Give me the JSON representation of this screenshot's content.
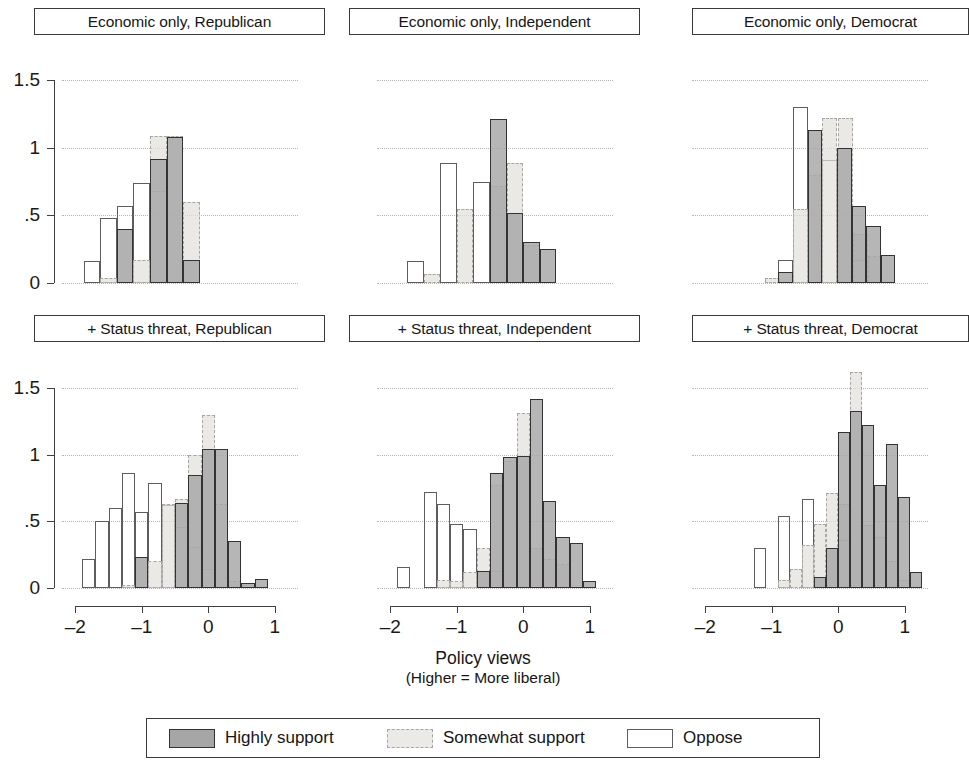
{
  "figure": {
    "xaxis_title": "Policy views",
    "xaxis_subtitle": "(Higher = More liberal)"
  },
  "legend": {
    "items": [
      {
        "key": "highly",
        "label": "Highly support",
        "swatch": "solid-gray-fill-swatch"
      },
      {
        "key": "somewhat",
        "label": "Somewhat support",
        "swatch": "dashed-light-gray-swatch"
      },
      {
        "key": "oppose",
        "label": "Oppose",
        "swatch": "hollow-outline-swatch"
      }
    ]
  },
  "chart_data": {
    "type": "bar",
    "chart_kind": "small-multiples histogram (density)",
    "title": "",
    "xlabel": "Policy views (Higher = More liberal)",
    "ylabel": "",
    "xlim": [
      -2.2,
      1.35
    ],
    "ylim": [
      0,
      1.5
    ],
    "xticks": [
      -2,
      -1,
      0,
      1
    ],
    "xtick_labels": [
      "–2",
      "–1",
      "0",
      "1"
    ],
    "yticks": [
      0,
      0.5,
      1,
      1.5
    ],
    "ytick_labels": [
      "0",
      ".5",
      "1",
      "1.5"
    ],
    "grid": "horizontal dotted gridlines at 0, .5, 1, 1.5",
    "legend_position": "bottom, outside, boxed",
    "series_names": [
      "Highly support",
      "Somewhat support",
      "Oppose"
    ],
    "panels": [
      {
        "id": "econ-republican",
        "title": "Economic only, Republican",
        "row": 0,
        "col": 0,
        "series": [
          {
            "name": "Oppose",
            "key": "oppose",
            "bin_width": 0.25,
            "bins": [
              -1.875,
              -1.625,
              -1.375,
              -1.125,
              -0.875
            ],
            "values": [
              0.16,
              0.48,
              0.57,
              0.74,
              0.68
            ]
          },
          {
            "name": "Somewhat support",
            "key": "somewhat",
            "bin_width": 0.25,
            "bins": [
              -1.625,
              -1.375,
              -1.125,
              -0.875,
              -0.625,
              -0.375
            ],
            "values": [
              0.04,
              0.4,
              0.17,
              1.09,
              1.09,
              0.6
            ]
          },
          {
            "name": "Highly support",
            "key": "highly",
            "bin_width": 0.25,
            "bins": [
              -1.375,
              -0.875,
              -0.625,
              -0.375
            ],
            "values": [
              0.4,
              0.92,
              1.08,
              0.17
            ]
          }
        ]
      },
      {
        "id": "econ-independent",
        "title": "Economic only, Independent",
        "row": 0,
        "col": 1,
        "series": [
          {
            "name": "Oppose",
            "key": "oppose",
            "bin_width": 0.25,
            "bins": [
              -1.75,
              -1.25,
              -0.75
            ],
            "values": [
              0.16,
              0.89,
              0.75
            ]
          },
          {
            "name": "Somewhat support",
            "key": "somewhat",
            "bin_width": 0.25,
            "bins": [
              -1.5,
              -1.0,
              -0.5,
              -0.25,
              0.0
            ],
            "values": [
              0.07,
              0.55,
              0.72,
              0.89,
              0.28
            ]
          },
          {
            "name": "Highly support",
            "key": "highly",
            "bin_width": 0.25,
            "bins": [
              -0.5,
              -0.25,
              0.0,
              0.25
            ],
            "values": [
              1.21,
              0.52,
              0.3,
              0.25
            ]
          }
        ]
      },
      {
        "id": "econ-democrat",
        "title": "Economic only, Democrat",
        "row": 0,
        "col": 2,
        "series": [
          {
            "name": "Oppose",
            "key": "oppose",
            "bin_width": 0.22,
            "bins": [
              -0.9,
              -0.68,
              -0.24,
              0.2
            ],
            "values": [
              0.17,
              1.3,
              0.91,
              0.17
            ]
          },
          {
            "name": "Somewhat support",
            "key": "somewhat",
            "bin_width": 0.22,
            "bins": [
              -1.1,
              -0.68,
              -0.46,
              -0.24,
              0.0,
              0.22,
              0.44
            ],
            "values": [
              0.04,
              0.55,
              0.8,
              1.22,
              1.22,
              0.36,
              0.2
            ]
          },
          {
            "name": "Highly support",
            "key": "highly",
            "bin_width": 0.22,
            "bins": [
              -0.9,
              -0.46,
              -0.02,
              0.2,
              0.42,
              0.64
            ],
            "values": [
              0.08,
              1.13,
              1.0,
              0.57,
              0.42,
              0.21
            ]
          }
        ]
      },
      {
        "id": "status-republican",
        "title": "+ Status threat, Republican",
        "row": 1,
        "col": 0,
        "series": [
          {
            "name": "Oppose",
            "key": "oppose",
            "bin_width": 0.2,
            "bins": [
              -1.9,
              -1.7,
              -1.5,
              -1.3,
              -1.1,
              -0.9,
              -0.7,
              -0.5,
              -0.3,
              -0.1
            ],
            "values": [
              0.22,
              0.5,
              0.6,
              0.86,
              0.57,
              0.79,
              0.62,
              0.46,
              0.31,
              0.14
            ]
          },
          {
            "name": "Somewhat support",
            "key": "somewhat",
            "bin_width": 0.2,
            "bins": [
              -1.3,
              -1.1,
              -0.9,
              -0.7,
              -0.5,
              -0.3,
              -0.1,
              0.1,
              0.3,
              0.5
            ],
            "values": [
              0.02,
              0.23,
              0.2,
              0.63,
              0.67,
              1.0,
              1.3,
              0.63,
              0.05,
              0.04
            ]
          },
          {
            "name": "Highly support",
            "key": "highly",
            "bin_width": 0.2,
            "bins": [
              -1.1,
              -0.5,
              -0.3,
              -0.1,
              0.1,
              0.3,
              0.5,
              0.7
            ],
            "values": [
              0.23,
              0.64,
              0.85,
              1.04,
              1.04,
              0.35,
              0.04,
              0.07
            ]
          }
        ]
      },
      {
        "id": "status-independent",
        "title": "+ Status threat, Independent",
        "row": 1,
        "col": 1,
        "series": [
          {
            "name": "Oppose",
            "key": "oppose",
            "bin_width": 0.2,
            "bins": [
              -1.9,
              -1.5,
              -1.3,
              -1.1,
              -0.9,
              -0.5
            ],
            "values": [
              0.16,
              0.72,
              0.63,
              0.48,
              0.44,
              0.13
            ]
          },
          {
            "name": "Somewhat support",
            "key": "somewhat",
            "bin_width": 0.2,
            "bins": [
              -1.3,
              -1.1,
              -0.9,
              -0.7,
              -0.5,
              -0.3,
              -0.1,
              0.1,
              0.3,
              0.5
            ],
            "values": [
              0.06,
              0.05,
              0.12,
              0.3,
              0.77,
              0.95,
              1.31,
              0.3,
              0.22,
              0.18
            ]
          },
          {
            "name": "Highly support",
            "key": "highly",
            "bin_width": 0.2,
            "bins": [
              -0.7,
              -0.5,
              -0.3,
              -0.1,
              0.1,
              0.3,
              0.5,
              0.7,
              0.9
            ],
            "values": [
              0.13,
              0.86,
              0.98,
              0.99,
              1.42,
              0.65,
              0.38,
              0.34,
              0.05
            ]
          }
        ]
      },
      {
        "id": "status-democrat",
        "title": "+ Status threat, Democrat",
        "row": 1,
        "col": 2,
        "series": [
          {
            "name": "Oppose",
            "key": "oppose",
            "bin_width": 0.18,
            "bins": [
              -1.26,
              -0.9,
              -0.54,
              0.0
            ],
            "values": [
              0.3,
              0.54,
              0.67,
              0.36
            ]
          },
          {
            "name": "Somewhat support",
            "key": "somewhat",
            "bin_width": 0.18,
            "bins": [
              -0.9,
              -0.72,
              -0.54,
              -0.36,
              -0.18,
              0.0,
              0.18,
              0.36,
              0.54,
              0.72,
              0.9
            ],
            "values": [
              0.06,
              0.14,
              0.32,
              0.48,
              0.71,
              0.63,
              1.62,
              0.47,
              0.38,
              0.2,
              0.06
            ]
          },
          {
            "name": "Highly support",
            "key": "highly",
            "bin_width": 0.18,
            "bins": [
              -0.36,
              -0.18,
              0.0,
              0.18,
              0.36,
              0.54,
              0.72,
              0.9,
              1.08
            ],
            "values": [
              0.08,
              0.3,
              1.17,
              1.33,
              1.22,
              0.77,
              1.08,
              0.68,
              0.12
            ]
          }
        ]
      }
    ]
  }
}
